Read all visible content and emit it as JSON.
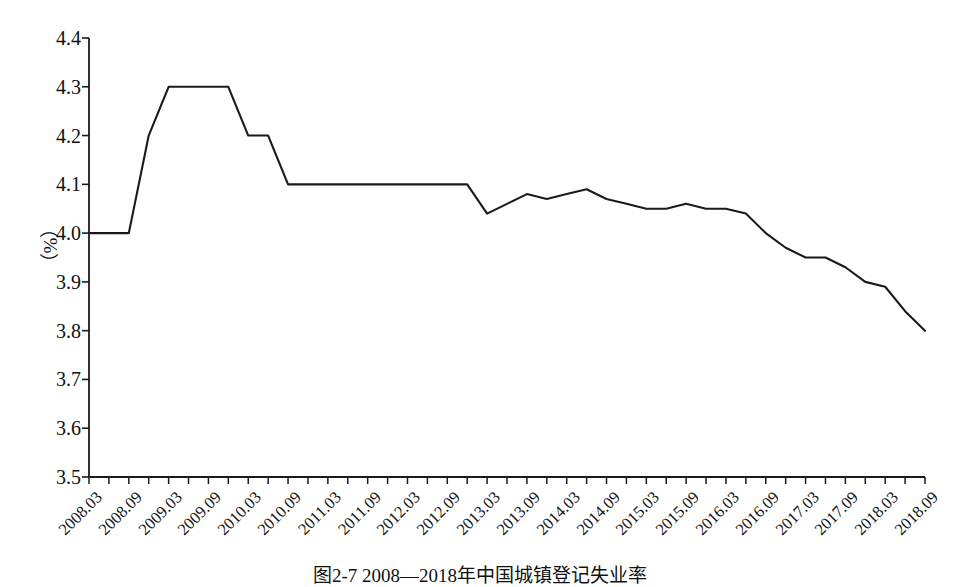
{
  "figure": {
    "caption": "图2-7  2008—2018年中国城镇登记失业率",
    "line_color": "#1a1a1a",
    "axis_color": "#1a1a1a",
    "background": "#ffffff"
  },
  "axis": {
    "y_label": "（%）",
    "y_ticks": [
      "4.4",
      "4.3",
      "4.2",
      "4.1",
      "4.0",
      "3.9",
      "3.8",
      "3.7",
      "3.6",
      "3.5"
    ],
    "x_tick_labels": [
      "2008.03",
      "2008.09",
      "2009.03",
      "2009.09",
      "2010.03",
      "2010.09",
      "2011.03",
      "2011.09",
      "2012.03",
      "2012.09",
      "2013.03",
      "2013.09",
      "2014.03",
      "2014.09",
      "2015.03",
      "2015.09",
      "2016.03",
      "2016.09",
      "2017.03",
      "2017.09",
      "2018.03",
      "2018.09"
    ]
  },
  "chart_data": {
    "type": "line",
    "title": "图2-7  2008—2018年中国城镇登记失业率",
    "xlabel": "",
    "ylabel": "（%）",
    "ylim": [
      3.5,
      4.4
    ],
    "ytick_step": 0.1,
    "grid": false,
    "legend": "none",
    "x": [
      "2008.03",
      "2008.06",
      "2008.09",
      "2008.12",
      "2009.03",
      "2009.06",
      "2009.09",
      "2009.12",
      "2010.03",
      "2010.06",
      "2010.09",
      "2010.12",
      "2011.03",
      "2011.06",
      "2011.09",
      "2011.12",
      "2012.03",
      "2012.06",
      "2012.09",
      "2012.12",
      "2013.03",
      "2013.06",
      "2013.09",
      "2013.12",
      "2014.03",
      "2014.06",
      "2014.09",
      "2014.12",
      "2015.03",
      "2015.06",
      "2015.09",
      "2015.12",
      "2016.03",
      "2016.06",
      "2016.09",
      "2016.12",
      "2017.03",
      "2017.06",
      "2017.09",
      "2017.12",
      "2018.03",
      "2018.06",
      "2018.09"
    ],
    "values": [
      4.0,
      4.0,
      4.0,
      4.2,
      4.3,
      4.3,
      4.3,
      4.3,
      4.2,
      4.2,
      4.1,
      4.1,
      4.1,
      4.1,
      4.1,
      4.1,
      4.1,
      4.1,
      4.1,
      4.1,
      4.04,
      4.06,
      4.08,
      4.07,
      4.08,
      4.09,
      4.07,
      4.06,
      4.05,
      4.05,
      4.06,
      4.05,
      4.05,
      4.04,
      4.0,
      3.97,
      3.95,
      3.95,
      3.93,
      3.9,
      3.89,
      3.84,
      3.8
    ],
    "series": [
      {
        "name": "城镇登记失业率",
        "values": [
          4.0,
          4.0,
          4.0,
          4.2,
          4.3,
          4.3,
          4.3,
          4.3,
          4.2,
          4.2,
          4.1,
          4.1,
          4.1,
          4.1,
          4.1,
          4.1,
          4.1,
          4.1,
          4.1,
          4.1,
          4.04,
          4.06,
          4.08,
          4.07,
          4.08,
          4.09,
          4.07,
          4.06,
          4.05,
          4.05,
          4.06,
          4.05,
          4.05,
          4.04,
          4.0,
          3.97,
          3.95,
          3.95,
          3.93,
          3.9,
          3.89,
          3.84,
          3.8
        ]
      }
    ]
  }
}
